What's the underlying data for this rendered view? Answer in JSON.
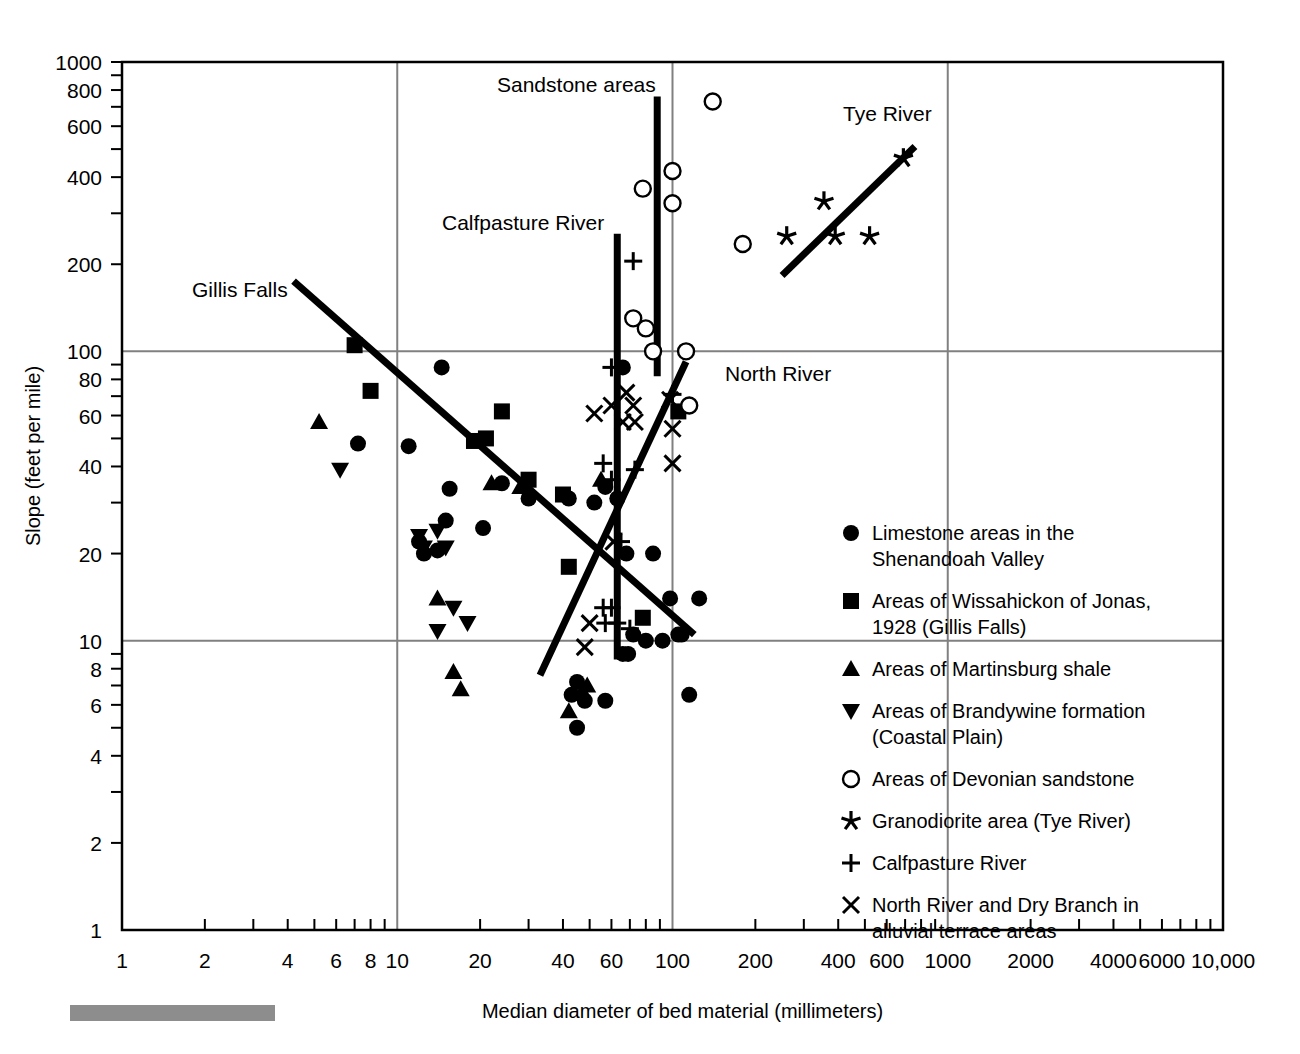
{
  "chart_data": {
    "type": "scatter",
    "title": "",
    "xlabel": "Median diameter of bed material (millimeters)",
    "ylabel": "Slope (feet per mile)",
    "xscale": "log",
    "yscale": "log",
    "xlim": [
      1,
      10000
    ],
    "ylim": [
      1,
      1000
    ],
    "grid": true,
    "grid_lines_x": [
      10,
      100,
      1000
    ],
    "grid_lines_y": [
      10,
      100
    ],
    "xticks": [
      1,
      2,
      4,
      6,
      8,
      10,
      20,
      40,
      60,
      100,
      200,
      400,
      600,
      1000,
      2000,
      4000,
      6000,
      10000
    ],
    "xticklabels": [
      "1",
      "2",
      "4",
      "6",
      "8",
      "10",
      "20",
      "40",
      "60",
      "100",
      "200",
      "400",
      "600",
      "1000",
      "2000",
      "4000",
      "6000",
      "10,000"
    ],
    "yticks": [
      2,
      4,
      6,
      8,
      10,
      20,
      40,
      60,
      80,
      100,
      200,
      400,
      600,
      800,
      1000
    ],
    "yticklabels": [
      "2",
      "4",
      "6",
      "8",
      "10",
      "20",
      "40",
      "60",
      "80",
      "100",
      "200",
      "400",
      "600",
      "800",
      "1000"
    ],
    "legend_position": "right-inside",
    "series": [
      {
        "name": "Limestone areas in the Shenandoah Valley",
        "marker": "filled-circle",
        "points": [
          [
            7.2,
            48
          ],
          [
            11,
            47
          ],
          [
            14.5,
            88
          ],
          [
            15,
            26
          ],
          [
            15.5,
            33.5
          ],
          [
            20.5,
            24.5
          ],
          [
            24,
            35
          ],
          [
            30,
            31
          ],
          [
            42,
            31
          ],
          [
            52,
            30
          ],
          [
            57,
            34
          ],
          [
            12,
            22
          ],
          [
            12.5,
            20
          ],
          [
            14,
            20.5
          ],
          [
            66,
            88
          ],
          [
            63,
            31
          ],
          [
            68,
            20
          ],
          [
            85,
            20
          ],
          [
            98,
            14
          ],
          [
            72,
            10.5
          ],
          [
            80,
            10
          ],
          [
            92,
            10
          ],
          [
            105,
            10.5
          ],
          [
            108,
            10.5
          ],
          [
            125,
            14
          ],
          [
            66,
            9
          ],
          [
            69,
            9
          ],
          [
            45,
            7.2
          ],
          [
            43,
            6.5
          ],
          [
            48,
            6.2
          ],
          [
            57,
            6.2
          ],
          [
            115,
            6.5
          ],
          [
            45,
            5.0
          ]
        ]
      },
      {
        "name": "Areas of Wissahickon of Jonas, 1928 (Gillis Falls)",
        "marker": "filled-square",
        "points": [
          [
            7.0,
            105
          ],
          [
            8.0,
            73
          ],
          [
            19,
            49
          ],
          [
            21,
            50
          ],
          [
            24,
            62
          ],
          [
            30,
            36
          ],
          [
            40,
            32
          ],
          [
            42,
            18
          ],
          [
            78,
            12
          ],
          [
            105,
            62
          ]
        ]
      },
      {
        "name": "Areas of Martinsburg shale",
        "marker": "filled-triangle-up",
        "points": [
          [
            5.2,
            57
          ],
          [
            14,
            14
          ],
          [
            22,
            35
          ],
          [
            28,
            34
          ],
          [
            55,
            36
          ],
          [
            16,
            7.8
          ],
          [
            17,
            6.8
          ],
          [
            47,
            6.7
          ],
          [
            49,
            7.0
          ],
          [
            42,
            5.7
          ]
        ]
      },
      {
        "name": "Areas of Brandywine formation (Coastal Plain)",
        "marker": "filled-triangle-down",
        "points": [
          [
            6.2,
            39
          ],
          [
            12,
            23
          ],
          [
            12.5,
            21
          ],
          [
            14,
            24
          ],
          [
            15,
            21
          ],
          [
            16,
            13
          ],
          [
            18,
            11.5
          ],
          [
            14,
            10.8
          ]
        ]
      },
      {
        "name": "Areas of Devonian sandstone",
        "marker": "open-circle",
        "points": [
          [
            78,
            365
          ],
          [
            100,
            420
          ],
          [
            100,
            325
          ],
          [
            140,
            730
          ],
          [
            180,
            235
          ],
          [
            72,
            130
          ],
          [
            80,
            120
          ],
          [
            85,
            100
          ],
          [
            112,
            100
          ],
          [
            115,
            65
          ]
        ]
      },
      {
        "name": "Granodiorite area (Tye River)",
        "marker": "star",
        "points": [
          [
            260,
            250
          ],
          [
            355,
            330
          ],
          [
            390,
            250
          ],
          [
            520,
            250
          ],
          [
            690,
            465
          ]
        ]
      },
      {
        "name": "Calfpasture River",
        "marker": "plus",
        "points": [
          [
            72,
            205
          ],
          [
            60,
            88
          ],
          [
            56,
            41
          ],
          [
            60,
            36
          ],
          [
            73,
            39
          ],
          [
            65,
            22
          ],
          [
            56,
            13
          ],
          [
            60,
            13
          ],
          [
            57,
            11.5
          ],
          [
            63,
            11.5
          ],
          [
            70,
            11
          ],
          [
            100,
            71
          ]
        ]
      },
      {
        "name": "North River and Dry Branch in alluvial terrace areas",
        "marker": "cross",
        "points": [
          [
            52,
            61
          ],
          [
            60,
            65
          ],
          [
            68,
            72
          ],
          [
            72,
            65
          ],
          [
            66,
            57
          ],
          [
            98,
            68
          ],
          [
            100,
            54
          ],
          [
            100,
            41
          ],
          [
            61,
            22
          ],
          [
            50,
            11.5
          ],
          [
            48,
            9.5
          ],
          [
            73,
            57
          ]
        ]
      }
    ],
    "trend_lines": [
      {
        "name": "Gillis Falls",
        "p1": [
          4.2,
          175
        ],
        "p2": [
          120,
          10.5
        ]
      },
      {
        "name": "North River",
        "p1": [
          33,
          7.6
        ],
        "p2": [
          112,
          92
        ]
      },
      {
        "name": "Tye River",
        "p1": [
          250,
          183
        ],
        "p2": [
          760,
          510
        ]
      },
      {
        "name": "Calfpasture River",
        "p1": [
          63,
          255
        ],
        "p2": [
          63,
          8.6
        ]
      },
      {
        "name": "Sandstone areas",
        "p1": [
          88,
          760
        ],
        "p2": [
          88,
          82
        ]
      }
    ],
    "annotations": [
      {
        "text": "Sandstone areas",
        "x": 497,
        "y": 92
      },
      {
        "text": "Tye River",
        "x": 843,
        "y": 121
      },
      {
        "text": "Calfpasture River",
        "x": 442,
        "y": 230
      },
      {
        "text": "Gillis Falls",
        "x": 192,
        "y": 297
      },
      {
        "text": "North River",
        "x": 725,
        "y": 381
      }
    ]
  },
  "axes": {
    "x_title": "Median diameter of bed material (millimeters)",
    "y_title": "Slope (feet per mile)"
  },
  "legend": {
    "items": [
      {
        "marker": "filled-circle",
        "lines": [
          "Limestone areas in the",
          "Shenandoah Valley"
        ]
      },
      {
        "marker": "filled-square",
        "lines": [
          "Areas of Wissahickon of Jonas,",
          "1928 (Gillis Falls)"
        ]
      },
      {
        "marker": "filled-triangle-up",
        "lines": [
          "Areas of Martinsburg shale"
        ]
      },
      {
        "marker": "filled-triangle-down",
        "lines": [
          "Areas of Brandywine formation",
          "(Coastal Plain)"
        ]
      },
      {
        "marker": "open-circle",
        "lines": [
          "Areas of Devonian sandstone"
        ]
      },
      {
        "marker": "star",
        "lines": [
          "Granodiorite area (Tye River)"
        ]
      },
      {
        "marker": "plus",
        "lines": [
          "Calfpasture River"
        ]
      },
      {
        "marker": "cross",
        "lines": [
          "North River and Dry Branch in",
          "alluvial terrace areas"
        ]
      }
    ]
  },
  "colors": {
    "ink": "#000000",
    "grid": "#808080",
    "gray_bar": "#8d8d8d",
    "background": "#ffffff"
  }
}
